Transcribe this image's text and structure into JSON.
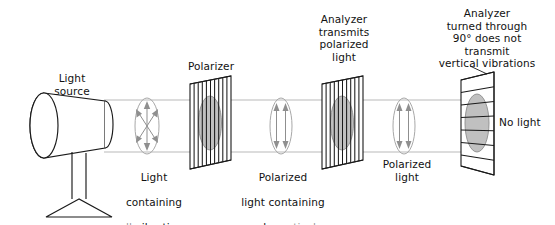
{
  "figure": {
    "background_color": "#ffffff",
    "text_color": "#111111",
    "dim_text_color": "#9a9a9a",
    "beam_color": "#b9b9b9",
    "sheet_fill_color": "#bdbdbd",
    "outline_color": "#1a1a1a"
  },
  "labels": {
    "light_source": "Light\nsource",
    "polarizer": "Polarizer",
    "analyzer_transmits": "Analyzer\ntransmits\npolarized\nlight",
    "analyzer_turned": "Analyzer\nturned through\n90° does not\ntransmit\nvertical vibrations",
    "unpolarized_line1": "Light",
    "unpolarized_line2": "containing",
    "unpolarized_dim_word": "all",
    "unpolarized_line3_rest": " vibrations",
    "polarized_line1": "Polarized",
    "polarized_line2": "light containing",
    "polarized_line3_prefix": "only ",
    "polarized_dim_word": "vertical",
    "polarized_line4": "vibrations",
    "polarized_light": "Polarized\nlight",
    "no_light": "No light"
  },
  "elements": {
    "light_source_icon": "lamp-icon",
    "polarizer_icon": "vertical-slat-filter-icon",
    "analyzer_icon": "vertical-slat-filter-icon",
    "crossed_analyzer_icon": "horizontal-slat-filter-icon",
    "unpolarized_symbol": "multi-direction-vibration-icon",
    "polarized_symbol": "vertical-vibration-icon"
  },
  "physics": {
    "analyzer_rotation_degrees": "90°",
    "stage1_state": "unpolarized light, all vibration directions",
    "stage2_state": "polarized light, vertical vibrations only",
    "stage3_state": "polarized light transmitted by aligned analyzer",
    "stage4_state": "no light transmitted by crossed analyzer"
  }
}
